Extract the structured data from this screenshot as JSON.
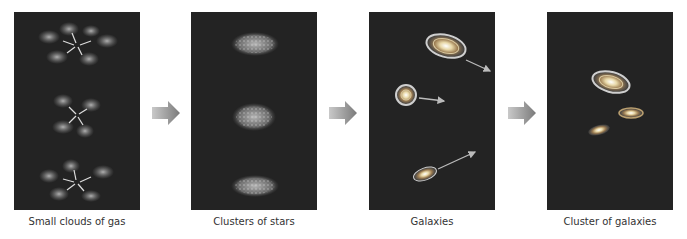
{
  "diagram": {
    "panels": [
      {
        "id": "gas",
        "caption": "Small clouds of gas"
      },
      {
        "id": "stars",
        "caption": "Clusters of stars"
      },
      {
        "id": "galaxies",
        "caption": "Galaxies"
      },
      {
        "id": "cluster",
        "caption": "Cluster of galaxies"
      }
    ],
    "arrows": [
      "arrow-right",
      "arrow-right",
      "arrow-right"
    ],
    "colors": {
      "panel_bg": "#232323",
      "arrow": "#8a8a8a",
      "caption": "#333333"
    }
  }
}
